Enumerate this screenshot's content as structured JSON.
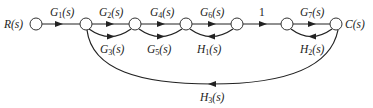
{
  "diagram": {
    "type": "signal-flow-graph",
    "input_label": "R(s)",
    "output_label": "C(s)",
    "nodes": [
      {
        "id": "R",
        "label": "R(s)"
      },
      {
        "id": "n1"
      },
      {
        "id": "n2"
      },
      {
        "id": "n3"
      },
      {
        "id": "n4"
      },
      {
        "id": "n5"
      },
      {
        "id": "C",
        "label": "C(s)"
      }
    ],
    "branches": [
      {
        "from": "R",
        "to": "n1",
        "gain": "G1(s)",
        "main": "G",
        "sub": "1"
      },
      {
        "from": "n1",
        "to": "n2",
        "gain": "G2(s)",
        "main": "G",
        "sub": "2"
      },
      {
        "from": "n1",
        "to": "n2",
        "gain": "G3(s)",
        "main": "G",
        "sub": "3"
      },
      {
        "from": "n2",
        "to": "n3",
        "gain": "G4(s)",
        "main": "G",
        "sub": "4"
      },
      {
        "from": "n2",
        "to": "n3",
        "gain": "G5(s)",
        "main": "G",
        "sub": "5"
      },
      {
        "from": "n3",
        "to": "n4",
        "gain": "G6(s)",
        "main": "G",
        "sub": "6"
      },
      {
        "from": "n4",
        "to": "n3",
        "gain": "H1(s)",
        "main": "H",
        "sub": "1"
      },
      {
        "from": "n4",
        "to": "n5",
        "gain": "1"
      },
      {
        "from": "n5",
        "to": "C",
        "gain": "G7(s)",
        "main": "G",
        "sub": "7"
      },
      {
        "from": "C",
        "to": "n5",
        "gain": "H2(s)",
        "main": "H",
        "sub": "2"
      },
      {
        "from": "C",
        "to": "n1",
        "gain": "H3(s)",
        "main": "H",
        "sub": "3"
      }
    ],
    "labels": {
      "R": "R(s)",
      "C": "C(s)",
      "one": "1",
      "G1": {
        "main": "G",
        "sub": "1",
        "tail": "(s)"
      },
      "G2": {
        "main": "G",
        "sub": "2",
        "tail": "(s)"
      },
      "G3": {
        "main": "G",
        "sub": "3",
        "tail": "(s)"
      },
      "G4": {
        "main": "G",
        "sub": "4",
        "tail": "(s)"
      },
      "G5": {
        "main": "G",
        "sub": "5",
        "tail": "(s)"
      },
      "G6": {
        "main": "G",
        "sub": "6",
        "tail": "(s)"
      },
      "G7": {
        "main": "G",
        "sub": "7",
        "tail": "(s)"
      },
      "H1": {
        "main": "H",
        "sub": "1",
        "tail": "(s)"
      },
      "H2": {
        "main": "H",
        "sub": "2",
        "tail": "(s)"
      },
      "H3": {
        "main": "H",
        "sub": "3",
        "tail": "(s)"
      }
    }
  }
}
